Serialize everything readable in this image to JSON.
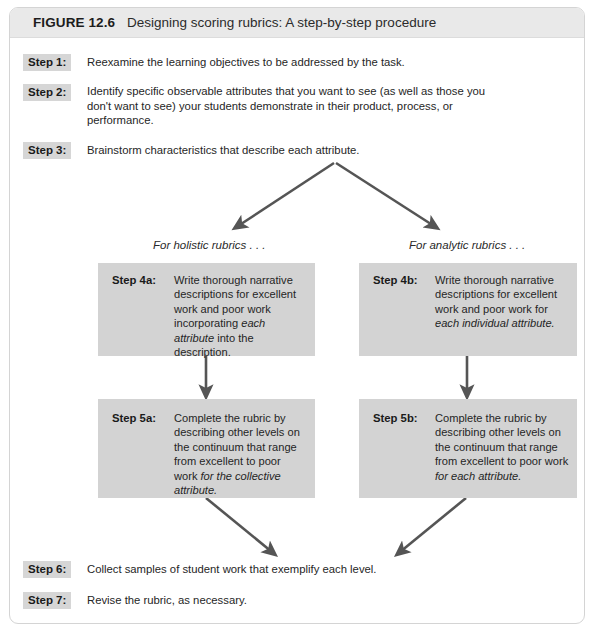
{
  "figure": {
    "number": "FIGURE 12.6",
    "title": "Designing scoring rubrics: A step-by-step procedure"
  },
  "steps": [
    {
      "label": "Step 1:",
      "text": "Reexamine the learning objectives to be addressed by the task."
    },
    {
      "label": "Step 2:",
      "text": "Identify specific observable attributes that you want to see (as well as those you don't want to see) your students demonstrate in their product, process, or performance."
    },
    {
      "label": "Step 3:",
      "text": "Brainstorm characteristics that describe each attribute."
    },
    {
      "label": "Step 6:",
      "text": "Collect samples of student work that exemplify each level."
    },
    {
      "label": "Step 7:",
      "text": "Revise the rubric, as necessary."
    }
  ],
  "branches": {
    "holistic_label": "For holistic rubrics . . .",
    "analytic_label": "For analytic rubrics . . ."
  },
  "boxes": {
    "step4a": {
      "label": "Step 4a:",
      "text_plain": "Write thorough narrative descriptions for excellent work and poor work incorporating each attribute into the description.",
      "text_before": "Write thorough narrative descriptions for excellent work and poor work incorporating ",
      "text_italic": "each attribute",
      "text_after": " into the description."
    },
    "step4b": {
      "label": "Step 4b:",
      "text_plain": "Write thorough narrative descriptions for excellent work and poor work for each individual attribute.",
      "text_before": "Write thorough narrative descriptions for excellent work and poor work for ",
      "text_italic": "each individual attribute.",
      "text_after": ""
    },
    "step5a": {
      "label": "Step 5a:",
      "text_plain": "Complete the rubric by describing other levels on the continuum that range from excellent to poor work for the collective attribute.",
      "text_before": "Complete the rubric by describing other levels on the continuum that range from excellent to poor work ",
      "text_italic": "for the collective attribute.",
      "text_after": ""
    },
    "step5b": {
      "label": "Step 5b:",
      "text_plain": "Complete the rubric by describing other levels on the continuum that range from excellent to poor work for each attribute.",
      "text_before": "Complete the rubric by describing other levels on the continuum that range from excellent to poor work ",
      "text_italic": "for each attribute.",
      "text_after": ""
    }
  },
  "colors": {
    "header_band": "#e9e9e9",
    "box_fill": "#d3d3d3",
    "chip_fill": "#d6d6d6",
    "arrow": "#555555",
    "card_border": "#d4d4d4"
  }
}
